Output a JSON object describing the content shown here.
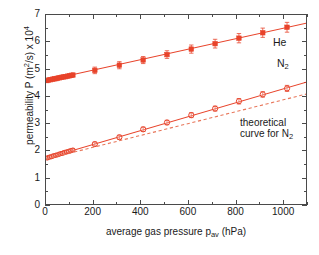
{
  "chart_data": {
    "type": "scatter",
    "title": "",
    "xlabel": "average gas pressure p_av (hPa)",
    "ylabel": "permeability P (m^2/s) x 10^4",
    "xlim": [
      0,
      1100
    ],
    "ylim": [
      0,
      7
    ],
    "xticks": [
      0,
      200,
      400,
      600,
      800,
      1000
    ],
    "yticks": [
      0,
      1,
      2,
      3,
      4,
      5,
      6,
      7
    ],
    "grid": false,
    "legend_position": "inline-annotations",
    "series": [
      {
        "name": "He",
        "marker": "filled-square",
        "color": "#e8432a",
        "line": "solid",
        "has_errorbars": true,
        "fit_intercept": 4.6,
        "fit_slope_per_hPa": 0.00192,
        "x": [
          5,
          12,
          20,
          28,
          35,
          43,
          50,
          58,
          66,
          74,
          82,
          90,
          98,
          106,
          114,
          205,
          308,
          408,
          508,
          610,
          710,
          810,
          910,
          1012
        ],
        "y": [
          4.6,
          4.62,
          4.63,
          4.65,
          4.66,
          4.67,
          4.69,
          4.7,
          4.72,
          4.73,
          4.74,
          4.76,
          4.77,
          4.79,
          4.8,
          4.97,
          5.16,
          5.35,
          5.55,
          5.75,
          5.95,
          6.15,
          6.35,
          6.55
        ],
        "yerr": [
          0.08,
          0.08,
          0.08,
          0.08,
          0.08,
          0.08,
          0.08,
          0.08,
          0.08,
          0.08,
          0.08,
          0.08,
          0.08,
          0.08,
          0.08,
          0.12,
          0.13,
          0.13,
          0.14,
          0.15,
          0.16,
          0.17,
          0.17,
          0.18
        ]
      },
      {
        "name": "N2",
        "marker": "open-circle",
        "color": "#e8432a",
        "line": "solid",
        "has_errorbars": true,
        "fit_intercept": 1.75,
        "fit_slope_per_hPa": 0.00255,
        "x": [
          5,
          14,
          23,
          32,
          41,
          50,
          59,
          68,
          77,
          86,
          95,
          104,
          113,
          205,
          308,
          408,
          508,
          610,
          710,
          810,
          910,
          1012
        ],
        "y": [
          1.76,
          1.79,
          1.81,
          1.84,
          1.86,
          1.88,
          1.91,
          1.93,
          1.96,
          1.98,
          2.0,
          2.03,
          2.05,
          2.27,
          2.52,
          2.81,
          3.06,
          3.33,
          3.57,
          3.84,
          4.09,
          4.31
        ],
        "yerr": [
          0.06,
          0.06,
          0.06,
          0.06,
          0.06,
          0.06,
          0.06,
          0.06,
          0.06,
          0.06,
          0.06,
          0.06,
          0.06,
          0.07,
          0.07,
          0.08,
          0.08,
          0.09,
          0.09,
          0.1,
          0.1,
          0.11
        ]
      },
      {
        "name": "theoretical curve for N2",
        "marker": "none",
        "color": "#e8765a",
        "line": "dashed",
        "has_errorbars": false,
        "fit_intercept": 1.72,
        "fit_slope_per_hPa": 0.00218,
        "x": [
          0,
          1100
        ],
        "y": [
          1.72,
          4.12
        ]
      }
    ],
    "annotations": [
      {
        "id": "he",
        "text": "He",
        "x_px": 273,
        "y_px": 42
      },
      {
        "id": "n2",
        "text": "N",
        "sub": "2",
        "x_px": 277,
        "y_px": 63
      },
      {
        "id": "theoretical_line1",
        "text": "theoretical",
        "x_px": 240,
        "y_px": 123
      },
      {
        "id": "theoretical_line2",
        "text": "curve for N",
        "sub": "2",
        "x_px": 240,
        "y_px": 136
      }
    ]
  },
  "axes": {
    "y_title_prefix": "permeability P (m",
    "y_title_sup1": "2",
    "y_title_mid": "/s) x 10",
    "y_title_sup2": "4",
    "x_title_prefix": "average gas pressure p",
    "x_title_sub": "av",
    "x_title_suffix": " (hPa)",
    "ytick_labels": [
      "7",
      "6",
      "5",
      "4",
      "3",
      "2",
      "1",
      "0"
    ],
    "xtick_labels": [
      "0",
      "200",
      "400",
      "600",
      "800",
      "1000"
    ]
  },
  "annotations": {
    "he_label": "He",
    "n2_label": "N",
    "n2_sub": "2",
    "theoretical_line1": "theoretical",
    "theoretical_line2": "curve for N",
    "theoretical_sub": "2"
  },
  "colors": {
    "data": "#e8432a",
    "theory": "#e8765a",
    "axis": "#4a4a4a",
    "text": "#1a1a1a",
    "background": "#ffffff"
  }
}
